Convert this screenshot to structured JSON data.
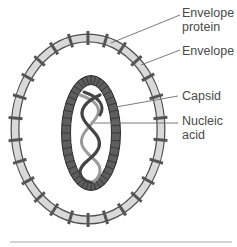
{
  "diagram": {
    "labels": [
      {
        "id": "envelope-protein",
        "line1": "Envelope",
        "line2": "protein"
      },
      {
        "id": "envelope",
        "line1": "Envelope",
        "line2": ""
      },
      {
        "id": "capsid",
        "line1": "Capsid",
        "line2": ""
      },
      {
        "id": "nucleic-acid",
        "line1": "Nucleic",
        "line2": "acid"
      }
    ],
    "colors": {
      "envelope_fill": "#d9d9d9",
      "envelope_stroke": "#4d4d4d",
      "protein_spike": "#555555",
      "capsid_fill": "#5e5e5e",
      "capsid_segment_lines": "#2f2f2f",
      "nucleic_dark": "#444444",
      "nucleic_light": "#9a9a9a",
      "leader_line": "#6b6b6b",
      "label_text": "#4a4a4a",
      "bottom_rule": "#aaaaaa"
    }
  }
}
